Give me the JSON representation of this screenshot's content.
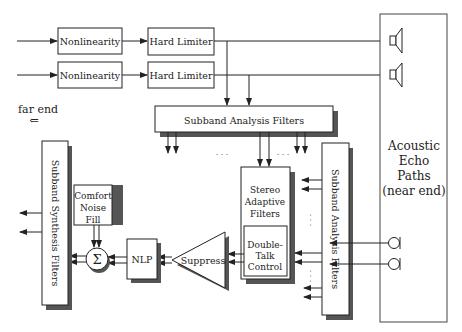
{
  "diagram": {
    "top_blocks": {
      "nonlinearity_1": "Nonlinearity",
      "nonlinearity_2": "Nonlinearity",
      "hard_limiter_1": "Hard Limiter",
      "hard_limiter_2": "Hard Limiter"
    },
    "far_end_label": "far end",
    "far_end_arrow": "⇐",
    "subband_analysis_top": "Subband Analysis Filters",
    "subband_analysis_right": "Subband Analysis Filters",
    "subband_synthesis": "Subband Synthesis Filters",
    "stereo_adaptive": [
      "Stereo",
      "Adaptive",
      "Filters"
    ],
    "double_talk": [
      "Double-",
      "Talk",
      "Control"
    ],
    "comfort_noise": [
      "Comfort",
      "Noise",
      "Fill"
    ],
    "sum_symbol": "Σ",
    "nlp": "NLP",
    "suppress": "Suppress",
    "acoustic_echo": [
      "Acoustic",
      "Echo",
      "Paths",
      "(near end)"
    ],
    "ellipsis": "· · ·",
    "icons": {
      "speaker": "speaker-icon",
      "microphone": "microphone-icon"
    },
    "colors": {
      "line": "#222222",
      "shadow": "#555555",
      "box_fill": "#ffffff"
    }
  }
}
